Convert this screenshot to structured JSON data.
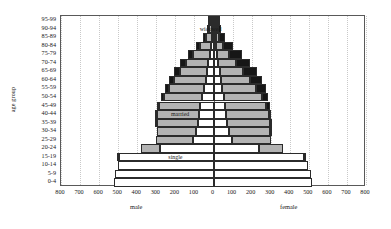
{
  "chart_data": {
    "type": "bar",
    "subtype": "population-pyramid",
    "title": "",
    "xlabel": "",
    "ylabel": "age group",
    "grid": true,
    "legend_position": "in-plot annotations",
    "xlim": [
      -800,
      800
    ],
    "x_ticks": [
      800,
      700,
      600,
      500,
      400,
      300,
      200,
      100,
      0,
      100,
      200,
      300,
      400,
      500,
      600,
      700,
      800
    ],
    "side_labels": {
      "left": "male",
      "right": "female"
    },
    "categories": [
      "0-4",
      "5-9",
      "10-14",
      "15-19",
      "20-24",
      "25-29",
      "30-34",
      "35-39",
      "40-44",
      "45-49",
      "50-54",
      "55-59",
      "60-64",
      "65-69",
      "70-74",
      "75-79",
      "80-84",
      "85-89",
      "90-94",
      "95-99"
    ],
    "stack_order_from_axis": [
      "single",
      "married",
      "widowed"
    ],
    "series": [
      {
        "name": "single",
        "side": "male",
        "color": "#ffffff",
        "values": [
          520,
          515,
          500,
          495,
          280,
          110,
          90,
          80,
          75,
          70,
          60,
          50,
          42,
          35,
          28,
          20,
          14,
          9,
          5,
          2
        ]
      },
      {
        "name": "married",
        "side": "male",
        "color": "#b3b3b3",
        "values": [
          0,
          0,
          0,
          5,
          100,
          190,
          205,
          215,
          220,
          215,
          200,
          185,
          165,
          140,
          115,
          85,
          55,
          30,
          13,
          4
        ]
      },
      {
        "name": "widowed",
        "side": "male",
        "color": "#161616",
        "values": [
          0,
          0,
          0,
          0,
          0,
          0,
          0,
          2,
          5,
          10,
          15,
          20,
          25,
          30,
          32,
          30,
          24,
          16,
          8,
          3
        ]
      },
      {
        "name": "single",
        "side": "female",
        "color": "#ffffff",
        "values": [
          515,
          510,
          495,
          475,
          240,
          95,
          80,
          72,
          68,
          62,
          55,
          46,
          38,
          32,
          26,
          19,
          13,
          8,
          4,
          2
        ]
      },
      {
        "name": "married",
        "side": "female",
        "color": "#b3b3b3",
        "values": [
          0,
          0,
          0,
          10,
          125,
          205,
          215,
          222,
          222,
          215,
          198,
          178,
          152,
          122,
          92,
          62,
          36,
          18,
          7,
          2
        ]
      },
      {
        "name": "widowed",
        "side": "female",
        "color": "#161616",
        "values": [
          0,
          0,
          0,
          0,
          0,
          0,
          2,
          6,
          12,
          22,
          35,
          50,
          62,
          72,
          76,
          70,
          55,
          34,
          16,
          5
        ]
      }
    ],
    "annotations": [
      {
        "id": "widowed-annot",
        "text": "widowed",
        "x": -15,
        "category": "90-94"
      },
      {
        "id": "married-annot",
        "text": "married",
        "x": -175,
        "category": "40-44"
      },
      {
        "id": "single-annot",
        "text": "single",
        "x": -200,
        "category": "15-19"
      }
    ]
  }
}
